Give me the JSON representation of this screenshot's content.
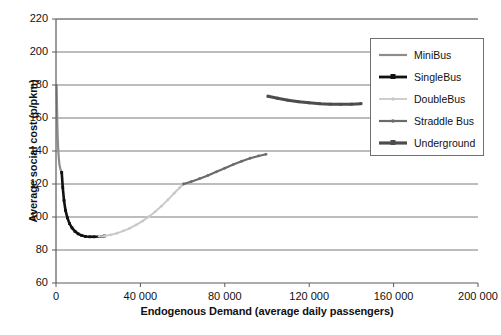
{
  "chart_data": {
    "type": "line",
    "title": "",
    "xlabel": "Endogenous Demand (average daily passengers)",
    "ylabel": "Average social cost (p/pkm)",
    "xlim": [
      0,
      200000
    ],
    "ylim": [
      60,
      220
    ],
    "xticks": [
      0,
      40000,
      80000,
      120000,
      160000,
      200000
    ],
    "xtick_labels": [
      "0",
      "40 000",
      "80 000",
      "120 000",
      "160 000",
      "200 000"
    ],
    "yticks": [
      60,
      80,
      100,
      120,
      140,
      160,
      180,
      200,
      220
    ],
    "ytick_labels": [
      "60",
      "80",
      "100",
      "120",
      "140",
      "160",
      "180",
      "200",
      "220"
    ],
    "grid": "horizontal",
    "legend_position": "upper right",
    "series": [
      {
        "name": "MiniBus",
        "color": "#8c8c8c",
        "width": 2.2,
        "marker": "none",
        "points": [
          [
            300,
            180.0
          ],
          [
            450,
            168.0
          ],
          [
            600,
            158.0
          ],
          [
            800,
            148.0
          ],
          [
            1000,
            142.0
          ],
          [
            1300,
            136.0
          ],
          [
            1600,
            132.0
          ],
          [
            2000,
            129.5
          ],
          [
            2400,
            127.8
          ],
          [
            2800,
            127.0
          ]
        ]
      },
      {
        "name": "SingleBus",
        "color": "#111111",
        "width": 2.6,
        "marker": "square-small",
        "points": [
          [
            2700,
            127.0
          ],
          [
            3200,
            118.0
          ],
          [
            3800,
            110.0
          ],
          [
            4500,
            104.0
          ],
          [
            5400,
            99.5
          ],
          [
            6400,
            96.0
          ],
          [
            7600,
            93.4
          ],
          [
            9000,
            91.3
          ],
          [
            10500,
            89.8
          ],
          [
            12200,
            88.8
          ],
          [
            14000,
            88.2
          ],
          [
            16000,
            88.0
          ],
          [
            18000,
            88.0
          ],
          [
            20500,
            88.2
          ],
          [
            23000,
            88.5
          ]
        ]
      },
      {
        "name": "DoubleBus",
        "color": "#c9c9c9",
        "width": 2.0,
        "marker": "dot",
        "points": [
          [
            20500,
            88.3
          ],
          [
            23000,
            88.5
          ],
          [
            26000,
            89.2
          ],
          [
            29000,
            90.2
          ],
          [
            32000,
            91.6
          ],
          [
            35000,
            93.2
          ],
          [
            38000,
            95.2
          ],
          [
            41000,
            97.5
          ],
          [
            44000,
            100.2
          ],
          [
            47000,
            103.2
          ],
          [
            50000,
            106.6
          ],
          [
            53000,
            110.4
          ],
          [
            56000,
            114.4
          ],
          [
            58500,
            117.6
          ],
          [
            60500,
            120.0
          ]
        ]
      },
      {
        "name": "Straddle Bus",
        "color": "#6b6b6b",
        "width": 2.2,
        "marker": "dot",
        "points": [
          [
            60500,
            120.0
          ],
          [
            64000,
            121.4
          ],
          [
            68000,
            123.2
          ],
          [
            72000,
            125.2
          ],
          [
            76000,
            127.4
          ],
          [
            80000,
            129.6
          ],
          [
            84000,
            131.8
          ],
          [
            88000,
            133.8
          ],
          [
            92000,
            135.6
          ],
          [
            96000,
            137.0
          ],
          [
            99500,
            138.0
          ]
        ]
      },
      {
        "name": "Underground",
        "color": "#4d4d4d",
        "width": 3.0,
        "marker": "square-small",
        "points": [
          [
            100500,
            173.2
          ],
          [
            105000,
            172.0
          ],
          [
            110000,
            170.8
          ],
          [
            115000,
            169.9
          ],
          [
            120000,
            169.2
          ],
          [
            125000,
            168.7
          ],
          [
            130000,
            168.4
          ],
          [
            135000,
            168.3
          ],
          [
            140000,
            168.4
          ],
          [
            144500,
            168.7
          ]
        ]
      }
    ]
  },
  "legend": {
    "items": [
      {
        "label": "MiniBus",
        "color": "#8c8c8c",
        "marker": "none",
        "width": 2.2
      },
      {
        "label": "SingleBus",
        "color": "#111111",
        "marker": "square",
        "width": 2.8
      },
      {
        "label": "DoubleBus",
        "color": "#c9c9c9",
        "marker": "dot",
        "width": 1.8
      },
      {
        "label": "Straddle Bus",
        "color": "#6b6b6b",
        "marker": "dot",
        "width": 2.2
      },
      {
        "label": "Underground",
        "color": "#4d4d4d",
        "marker": "square",
        "width": 3.2
      }
    ]
  },
  "style": {
    "axis_color": "#5a5a5a",
    "grid_color": "#7a7a7a",
    "background": "#ffffff",
    "text_color": "#111111"
  }
}
